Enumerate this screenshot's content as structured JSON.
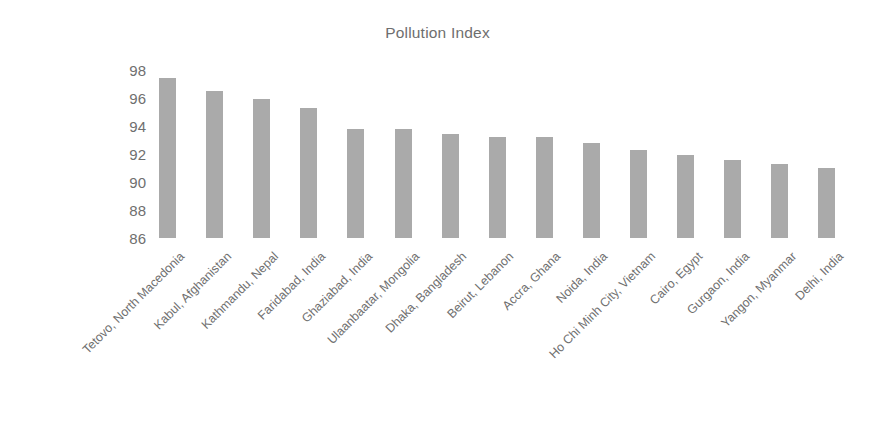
{
  "chart_data": {
    "type": "bar",
    "title": "Pollution Index",
    "xlabel": "",
    "ylabel": "",
    "ylim": [
      86,
      98
    ],
    "yticks": [
      86,
      88,
      90,
      92,
      94,
      96,
      98
    ],
    "grid": false,
    "legend": null,
    "orientation": "vertical",
    "bar_color": "#aaaaaa",
    "categories": [
      "Tetovo, North Macedonia",
      "Kabul, Afghanistan",
      "Kathmandu, Nepal",
      "Faridabad, India",
      "Ghaziabad, India",
      "Ulaanbaatar, Mongolia",
      "Dhaka, Bangladesh",
      "Beirut, Lebanon",
      "Accra, Ghana",
      "Noida, India",
      "Ho Chi Minh City, Vietnam",
      "Cairo, Egypt",
      "Gurgaon, India",
      "Yangon, Myanmar",
      "Delhi, India"
    ],
    "values": [
      97.4,
      96.5,
      95.9,
      95.3,
      93.8,
      93.8,
      93.4,
      93.2,
      93.2,
      92.8,
      92.3,
      91.9,
      91.6,
      91.3,
      91.0
    ]
  },
  "colors": {
    "bar": "#aaaaaa",
    "text": "#6f6f6f",
    "background": "#ffffff"
  }
}
